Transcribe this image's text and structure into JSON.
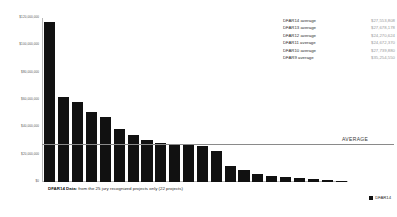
{
  "chart_data": {
    "type": "bar",
    "title": "",
    "subtitle": "",
    "xlabel": "",
    "ylabel": "",
    "ylim": [
      0,
      120000000
    ],
    "grid": false,
    "legend_position": "bottom-right",
    "categories": [
      "1",
      "2",
      "3",
      "4",
      "5",
      "6",
      "7",
      "8",
      "9",
      "10",
      "11",
      "12",
      "13",
      "14",
      "15",
      "16",
      "17",
      "18",
      "19",
      "20",
      "21",
      "22"
    ],
    "series": [
      {
        "name": "DFAR14",
        "color": "#111111",
        "values": [
          117000000,
          62500000,
          58500000,
          51000000,
          47500000,
          38500000,
          34500000,
          30500000,
          28500000,
          28000000,
          28000000,
          26500000,
          22500000,
          11500000,
          8500000,
          5500000,
          4500000,
          3500000,
          3000000,
          2200000,
          1600000,
          900000
        ]
      }
    ],
    "yticks": [
      0,
      20000000,
      40000000,
      60000000,
      80000000,
      100000000,
      120000000
    ],
    "ytick_labels": [
      "$0",
      "$20,000,000",
      "$40,000,000",
      "$60,000,000",
      "$80,000,000",
      "$100,000,000",
      "$120,000,000"
    ],
    "annotations": [
      {
        "name": "average-line",
        "label": "AVERAGE",
        "value": 27553808
      }
    ]
  },
  "side_table": {
    "rows": [
      {
        "label": "DFAR14 average",
        "value": "$27,553,808"
      },
      {
        "label": "DFAR13 average",
        "value": "$27,678,178"
      },
      {
        "label": "DFAR12 average",
        "value": "$24,270,624"
      },
      {
        "label": "DFAR11 average",
        "value": "$24,672,370"
      },
      {
        "label": "DFAR10 average",
        "value": "$27,739,880"
      },
      {
        "label": "DFAR9 average",
        "value": "$35,254,550"
      }
    ]
  },
  "caption": {
    "strong": "DFAR14 Data:",
    "rest": " from the 25 jury recognized projects only (22 projects)"
  },
  "legend": {
    "items": [
      {
        "label": "DFAR14",
        "color": "#111111"
      }
    ]
  },
  "colors": {
    "bar": "#111111",
    "axis": "#b9b9b9",
    "average_line": "#8a8a8a",
    "muted_text": "#9a9a9a"
  }
}
